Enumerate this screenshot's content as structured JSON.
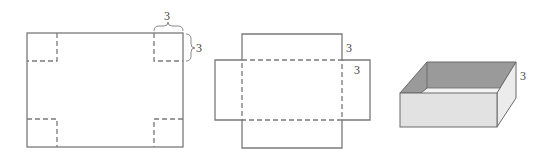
{
  "figures": {
    "flat_sheet": {
      "label_top": "3",
      "label_side": "3"
    },
    "net": {
      "label_top": "3",
      "label_flap": "3"
    },
    "box": {
      "label_height": "3",
      "colors": {
        "inner_wall": "#9a9a9a",
        "front_face": "#e2e2e2",
        "side_face": "#ececec",
        "floor": "#f4f4f4",
        "edge": "#6a6a6a"
      }
    }
  }
}
